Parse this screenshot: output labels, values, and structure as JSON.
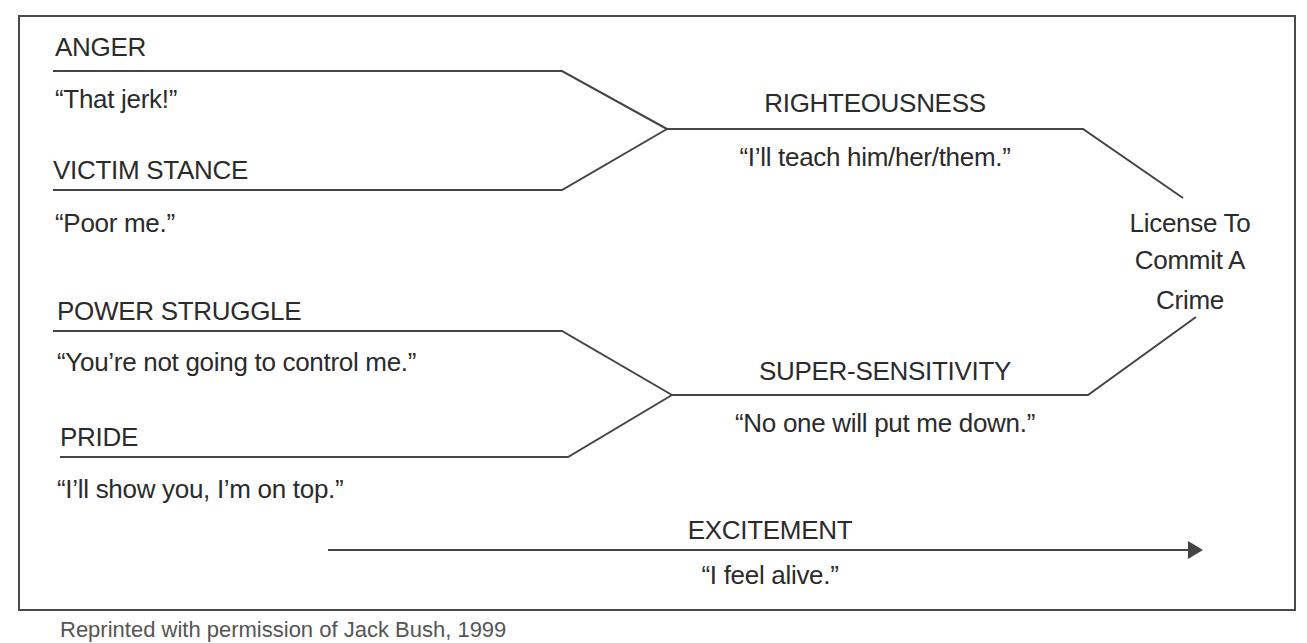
{
  "diagram": {
    "inputs": [
      {
        "label": "ANGER",
        "quote": "“That jerk!”"
      },
      {
        "label": "VICTIM STANCE",
        "quote": "“Poor me.”"
      },
      {
        "label": "POWER STRUGGLE",
        "quote": "“You’re not going to control me.”"
      },
      {
        "label": "PRIDE",
        "quote": "“I’ll show you, I’m on top.”"
      }
    ],
    "merges": [
      {
        "label": "RIGHTEOUSNESS",
        "quote": "“I’ll teach him/her/them.”"
      },
      {
        "label": "SUPER-SENSITIVITY",
        "quote": "“No one will put me down.”"
      }
    ],
    "outcome": {
      "line1": "License To",
      "line2": "Commit A",
      "line3": "Crime"
    },
    "arrow": {
      "label": "EXCITEMENT",
      "quote": "“I feel alive.”"
    }
  },
  "caption": "Reprinted with permission of Jack Bush, 1999"
}
